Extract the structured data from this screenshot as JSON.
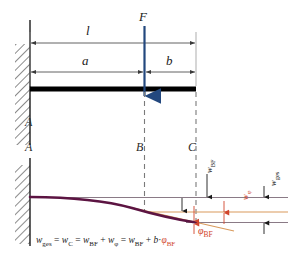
{
  "figure": {
    "type": "engineering-diagram",
    "background_color": "#ffffff"
  },
  "colors": {
    "force_arrow": "#23487e",
    "beam": "#000000",
    "deflection_curve": "#5c1442",
    "reference_line": "#8a7a86",
    "tangent_line": "#d99a5c",
    "annotation_red": "#d1452c",
    "dimension_line": "#4a4a4a",
    "dashed_line": "#7a7a7a",
    "hatch": "#2b2b2b",
    "text": "#1a1a1a"
  },
  "top_view": {
    "force": {
      "label": "F",
      "direction": "down"
    },
    "dimensions": [
      {
        "name": "l",
        "label": "l",
        "from": "A",
        "to": "C"
      },
      {
        "name": "a",
        "label": "a",
        "from": "A",
        "to": "B"
      },
      {
        "name": "b",
        "label": "b",
        "from": "B",
        "to": "C"
      }
    ],
    "support": {
      "type": "fixed-wall",
      "label": "A"
    }
  },
  "bottom_view": {
    "nodes": [
      {
        "name": "A",
        "label": "A"
      },
      {
        "name": "B",
        "label": "B"
      },
      {
        "name": "C",
        "label": "C"
      }
    ],
    "vertical_labels": [
      {
        "name": "w-bf",
        "text": "w",
        "sub": "BF",
        "color": "#1a1a1a"
      },
      {
        "name": "w-phi",
        "text": "w",
        "sub": "φ",
        "color": "#d1452c"
      },
      {
        "name": "w-ges",
        "text": "w",
        "sub": "ges",
        "color": "#1a1a1a"
      }
    ],
    "angle_label": {
      "text": "φ",
      "sub": "BF"
    },
    "formula": {
      "parts": [
        {
          "t": "w",
          "style": "it"
        },
        {
          "t": "ges",
          "style": "sub"
        },
        {
          "t": " = ",
          "style": "plain"
        },
        {
          "t": "w",
          "style": "it"
        },
        {
          "t": "C",
          "style": "sub"
        },
        {
          "t": " = ",
          "style": "plain"
        },
        {
          "t": "w",
          "style": "it"
        },
        {
          "t": "BF",
          "style": "sub"
        },
        {
          "t": " + ",
          "style": "plain"
        },
        {
          "t": "w",
          "style": "it"
        },
        {
          "t": "φ",
          "style": "sub"
        },
        {
          "t": " = ",
          "style": "plain"
        },
        {
          "t": "w",
          "style": "it"
        },
        {
          "t": "BF",
          "style": "sub"
        },
        {
          "t": " + ",
          "style": "plain"
        },
        {
          "t": "b",
          "style": "it"
        },
        {
          "t": "·",
          "style": "plain"
        },
        {
          "t": "φ",
          "style": "red-it"
        },
        {
          "t": "BF",
          "style": "red-sub"
        }
      ],
      "plain_text": "w_ges = w_C = w_BF + w_φ = w_BF + b·φ_BF"
    }
  }
}
